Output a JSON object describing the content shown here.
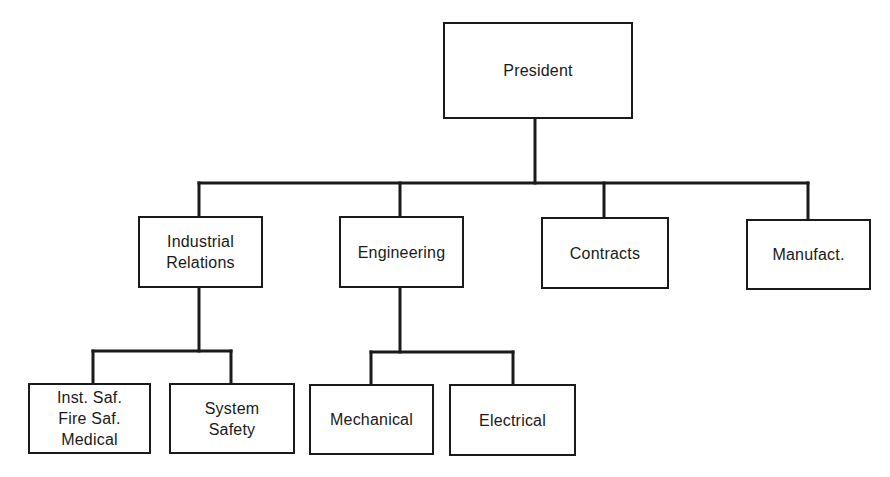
{
  "diagram": {
    "type": "org-chart",
    "colors": {
      "line": "#1a1a1a",
      "background": "#ffffff",
      "box_fill": "#ffffff"
    },
    "nodes": {
      "president": {
        "label": "President",
        "x": 443,
        "y": 22,
        "w": 190,
        "h": 97
      },
      "industrial_relations": {
        "label": "Industrial\nRelations",
        "x": 138,
        "y": 216,
        "w": 125,
        "h": 72,
        "parent": "president"
      },
      "engineering": {
        "label": "Engineering",
        "x": 339,
        "y": 216,
        "w": 125,
        "h": 72,
        "parent": "president"
      },
      "contracts": {
        "label": "Contracts",
        "x": 541,
        "y": 217,
        "w": 128,
        "h": 72,
        "parent": "president"
      },
      "manufacturing": {
        "label": "Manufact.",
        "x": 746,
        "y": 219,
        "w": 125,
        "h": 71,
        "parent": "president"
      },
      "inst_fire_medical": {
        "label": "Inst. Saf.\nFire Saf.\nMedical",
        "x": 28,
        "y": 383,
        "w": 123,
        "h": 71,
        "parent": "industrial_relations"
      },
      "system_safety": {
        "label": "System\nSafety",
        "x": 169,
        "y": 383,
        "w": 126,
        "h": 71,
        "parent": "industrial_relations"
      },
      "mechanical": {
        "label": "Mechanical",
        "x": 309,
        "y": 384,
        "w": 125,
        "h": 71,
        "parent": "engineering"
      },
      "electrical": {
        "label": "Electrical",
        "x": 449,
        "y": 384,
        "w": 127,
        "h": 72,
        "parent": "engineering"
      }
    },
    "edges": [
      {
        "from": "president",
        "to": "industrial_relations"
      },
      {
        "from": "president",
        "to": "engineering"
      },
      {
        "from": "president",
        "to": "contracts"
      },
      {
        "from": "president",
        "to": "manufacturing"
      },
      {
        "from": "industrial_relations",
        "to": "inst_fire_medical"
      },
      {
        "from": "industrial_relations",
        "to": "system_safety"
      },
      {
        "from": "engineering",
        "to": "mechanical"
      },
      {
        "from": "engineering",
        "to": "electrical"
      }
    ]
  }
}
